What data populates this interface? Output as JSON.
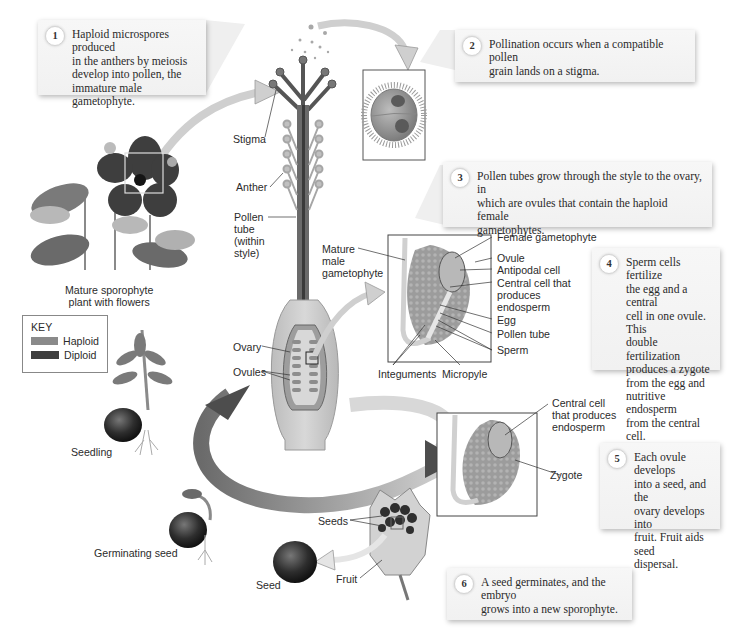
{
  "figure": {
    "colors": {
      "haploid": "#8a8a8a",
      "diploid": "#3e3e3e",
      "callout_bg": "#f3f3f3",
      "arrow_fill": "#d8d8d8"
    }
  },
  "steps": [
    {
      "number": "1",
      "text": "Haploid microspores produced\nin the anthers by meiosis\ndevelop into pollen, the\nimmature male gametophyte."
    },
    {
      "number": "2",
      "text": "Pollination occurs when a compatible pollen\ngrain lands on a stigma."
    },
    {
      "number": "3",
      "text": "Pollen tubes grow through the style to the ovary, in\nwhich are ovules that contain the haploid female\ngametophytes."
    },
    {
      "number": "4",
      "text": "Sperm cells fertilize\nthe egg and a central\ncell in one ovule. This\ndouble fertilization\nproduces a zygote\nfrom the egg and\nnutritive endosperm\nfrom the central cell."
    },
    {
      "number": "5",
      "text": "Each ovule develops\ninto a seed, and the\novary develops into\nfruit. Fruit aids seed\ndispersal."
    },
    {
      "number": "6",
      "text": "A seed germinates, and the embryo\ngrows into a new sporophyte."
    }
  ],
  "labels": {
    "mature_sporophyte": "Mature sporophyte\nplant with flowers",
    "stigma": "Stigma",
    "anther": "Anther",
    "pollen_tube_style": "Pollen\ntube\n(within\nstyle)",
    "mature_male_gametophyte": "Mature\nmale\ngametophyte",
    "ovary": "Ovary",
    "ovules": "Ovules",
    "female_gametophyte": "Female gametophyte",
    "ovule": "Ovule",
    "antipodal_cell": "Antipodal cell",
    "central_cell": "Central cell that\nproduces\nendosperm",
    "egg": "Egg",
    "pollen_tube": "Pollen tube",
    "sperm": "Sperm",
    "integuments": "Integuments",
    "micropyle": "Micropyle",
    "central_cell_2": "Central cell\nthat produces\nendosperm",
    "zygote": "Zygote",
    "seedling": "Seedling",
    "germinating_seed": "Germinating seed",
    "seeds": "Seeds",
    "seed": "Seed",
    "fruit": "Fruit"
  },
  "key": {
    "title": "KEY",
    "items": [
      {
        "label": "Haploid",
        "color": "#8a8a8a"
      },
      {
        "label": "Diploid",
        "color": "#3e3e3e"
      }
    ]
  }
}
